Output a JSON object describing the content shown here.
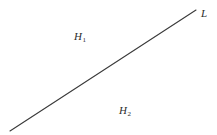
{
  "figure": {
    "background_color": "#ffffff",
    "line_color": "#3a3a3a",
    "text_color": "#2b2b2b",
    "width": 217,
    "height": 135,
    "line": {
      "name": "L",
      "label": "L",
      "x1": 10,
      "y1": 131,
      "x2": 196,
      "y2": 10,
      "stroke_width": 1.1
    },
    "labels": {
      "line_label": {
        "base": "L",
        "subscript": "",
        "x": 204,
        "y": 10
      },
      "upper_region": {
        "base": "H",
        "subscript": "1",
        "x": 82,
        "y": 33
      },
      "lower_region": {
        "base": "H",
        "subscript": "2",
        "x": 128,
        "y": 108
      }
    }
  }
}
